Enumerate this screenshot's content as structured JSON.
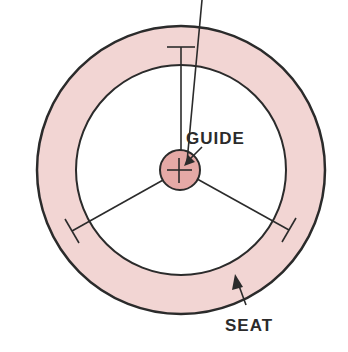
{
  "diagram": {
    "labels": {
      "guide": "GUIDE",
      "seat": "SEAT"
    },
    "colors": {
      "seat_fill": "#f2d5d3",
      "guide_fill": "#e5a9a6",
      "stroke": "#2b2b2b",
      "background": "#ffffff"
    },
    "parts": [
      "seat-ring",
      "guide-hub",
      "spokes"
    ],
    "spoke_count": 3
  }
}
